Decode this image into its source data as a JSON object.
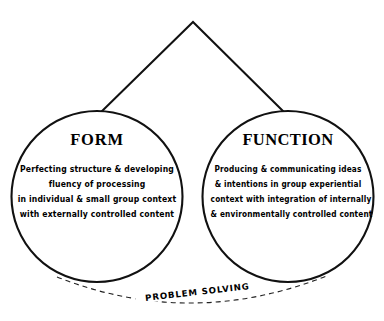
{
  "diagram": {
    "background_color": "#ffffff",
    "stroke_color": "#111111",
    "lobes": [
      {
        "id": "form",
        "heading": "FORM",
        "lines": [
          "Perfecting structure & developing",
          "fluency of processing",
          "in individual & small group context",
          "with externally controlled content"
        ]
      },
      {
        "id": "function",
        "heading": "FUNCTION",
        "lines": [
          "Producing & communicating ideas",
          "& intentions in group experiential",
          "context with integration of internally",
          "& environmentally controlled content"
        ]
      }
    ],
    "connector": {
      "name": "peak-connector",
      "style": "solid",
      "apex": [
        193,
        22
      ]
    },
    "arc": {
      "name": "problem-solving-arc",
      "style": "dashed",
      "label": "PROBLEM   SOLVING"
    }
  }
}
